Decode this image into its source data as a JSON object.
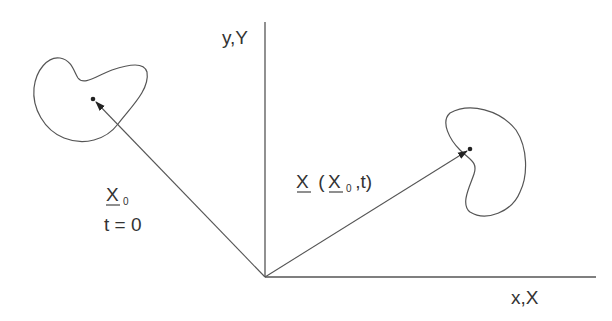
{
  "diagram": {
    "type": "continuum-kinematics",
    "colors": {
      "line": "#555555",
      "text": "#333333",
      "background": "#ffffff"
    },
    "axes": {
      "y_label": "y,Y",
      "x_label": "x,X",
      "origin": [
        265,
        277
      ]
    },
    "initial_config": {
      "vector_label": "X",
      "vector_subscript": "0",
      "time_label": "t = 0"
    },
    "current_config": {
      "vector_label": "X",
      "open_paren": " (",
      "arg_label": "X",
      "arg_subscript": "0",
      "tail": " ,t)"
    }
  }
}
